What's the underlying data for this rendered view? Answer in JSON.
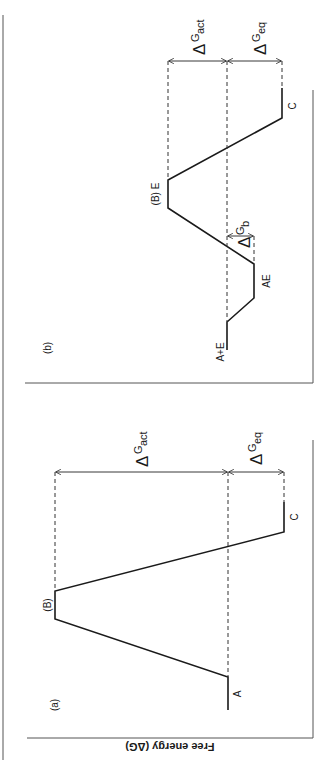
{
  "figure": {
    "axis_label": "Free energy (ΔG)",
    "panels": [
      {
        "id": "a",
        "label": "(a)",
        "states": [
          "A",
          "(B)",
          "C"
        ],
        "annotations": {
          "dg_act": {
            "delta": "Δ",
            "g": "G",
            "sub": "act"
          },
          "dg_eq": {
            "delta": "Δ",
            "g": "G",
            "sub": "eq"
          }
        }
      },
      {
        "id": "b",
        "label": "(b)",
        "states": [
          "A+E",
          "AE",
          "(B) E",
          "C"
        ],
        "annotations": {
          "dg_b": {
            "delta": "Δ",
            "g": "G",
            "sub": "b"
          },
          "dg_act": {
            "delta": "Δ",
            "g": "G",
            "sub": "act"
          },
          "dg_eq": {
            "delta": "Δ",
            "g": "G",
            "sub": "eq"
          }
        }
      }
    ]
  }
}
